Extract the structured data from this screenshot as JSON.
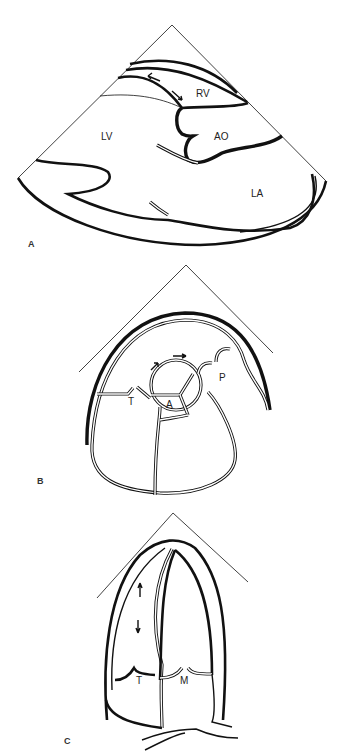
{
  "figure": {
    "panels": [
      {
        "id": "A",
        "label": "A",
        "view": "parasternal long axis",
        "structures": {
          "rv": "RV",
          "lv": "LV",
          "ao": "AO",
          "la": "LA"
        }
      },
      {
        "id": "B",
        "label": "B",
        "view": "parasternal short axis",
        "structures": {
          "t": "T",
          "a": "A",
          "p": "P"
        }
      },
      {
        "id": "C",
        "label": "C",
        "view": "apical four chamber",
        "structures": {
          "t": "T",
          "m": "M"
        }
      }
    ]
  }
}
